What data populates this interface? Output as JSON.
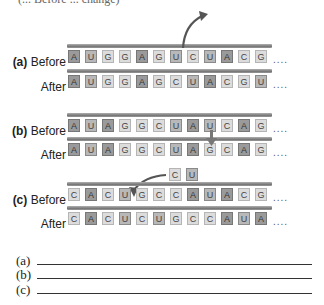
{
  "header": {
    "cut_text": "(... Before ... change)"
  },
  "colors": {
    "A": "#9a9a9a",
    "U": "#b8b8b8",
    "G": "#dcdcdc",
    "C": "#dcdcdc",
    "strand": "#888888"
  },
  "sections": [
    {
      "id": "a",
      "letter": "(a)",
      "before_label": "Before",
      "after_label": "After",
      "before": [
        "A",
        "U",
        "G",
        "G",
        "A",
        "G",
        "U",
        "C",
        "U",
        "A",
        "C",
        "G"
      ],
      "after": [
        "A",
        "U",
        "G",
        "G",
        "A",
        "G",
        "C",
        "U",
        "A",
        "C",
        "G",
        "U"
      ],
      "annotation": "deletion-arrow-out"
    },
    {
      "id": "b",
      "letter": "(b)",
      "before_label": "Before",
      "after_label": "After",
      "before": [
        "A",
        "U",
        "A",
        "G",
        "G",
        "C",
        "U",
        "A",
        "U",
        "C",
        "A",
        "G"
      ],
      "after": [
        "A",
        "U",
        "A",
        "G",
        "G",
        "C",
        "U",
        "A",
        "G",
        "C",
        "A",
        "G"
      ],
      "annotation": "substitution-arrow-down"
    },
    {
      "id": "c",
      "letter": "(c)",
      "before_label": "Before",
      "after_label": "After",
      "before": [
        "C",
        "A",
        "C",
        "U",
        "G",
        "C",
        "C",
        "A",
        "U",
        "A",
        "C",
        "G"
      ],
      "after": [
        "C",
        "A",
        "C",
        "U",
        "C",
        "U",
        "G",
        "C",
        "C",
        "A",
        "U",
        "A"
      ],
      "inserted": [
        "C",
        "U"
      ],
      "annotation": "insertion-arrow-in"
    }
  ],
  "ellipsis": "....",
  "answers": [
    {
      "label": "(a)",
      "value": ""
    },
    {
      "label": "(b)",
      "value": ""
    },
    {
      "label": "(c)",
      "value": ""
    }
  ]
}
